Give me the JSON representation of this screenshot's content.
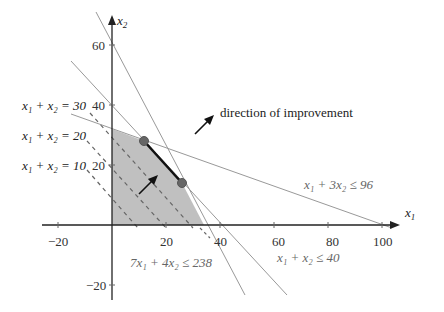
{
  "diagram": {
    "type": "linear-program-feasible-region",
    "axes": {
      "x_label": "x1",
      "y_label": "x2",
      "x_ticks": [
        -20,
        20,
        40,
        60,
        80,
        100
      ],
      "y_ticks": [
        60,
        40,
        20,
        -20
      ],
      "x_tick_labels": [
        "−20",
        "20",
        "40",
        "60",
        "80",
        "100"
      ],
      "y_tick_labels": [
        "60",
        "40",
        "20",
        "−20"
      ]
    },
    "constraints": [
      {
        "label": "7x₁ + 4x₂ ≤ 238",
        "a": 7,
        "b": 4,
        "c": 238
      },
      {
        "label": "x₁ + x₂ ≤ 40",
        "a": 1,
        "b": 1,
        "c": 40
      },
      {
        "label": "x₁ + 3x₂ ≤ 96",
        "a": 1,
        "b": 3,
        "c": 96
      }
    ],
    "level_sets": [
      {
        "label": "x₁ + x₂ = 30",
        "value": 30
      },
      {
        "label": "x₁ + x₂ = 20",
        "value": 20
      },
      {
        "label": "x₁ + x₂ = 10",
        "value": 10
      }
    ],
    "feasible_region_vertices": [
      [
        0,
        0
      ],
      [
        34,
        0
      ],
      [
        26,
        14
      ],
      [
        12,
        28
      ],
      [
        0,
        32
      ]
    ],
    "optimal_face": [
      [
        12,
        28
      ],
      [
        26,
        14
      ]
    ],
    "annotation": "direction of improvement",
    "colors": {
      "region": "#c0c0c0",
      "axis": "#222222",
      "constraint": "#999999",
      "dashed": "#666666",
      "vertex": "#666666",
      "optimal_edge": "#111111"
    }
  }
}
